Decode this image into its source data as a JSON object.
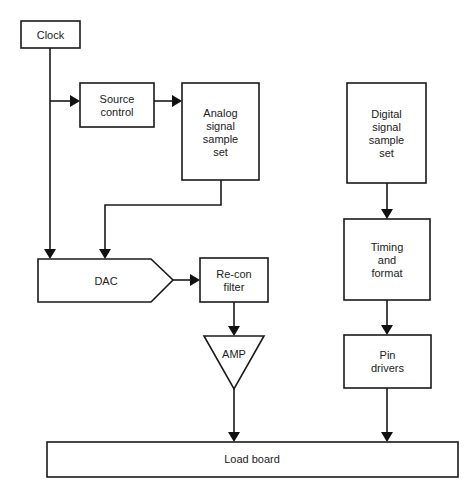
{
  "diagram": {
    "nodes": {
      "clock": {
        "label": [
          "Clock"
        ]
      },
      "source_control": {
        "label": [
          "Source",
          "control"
        ]
      },
      "analog_set": {
        "label": [
          "Analog",
          "signal",
          "sample",
          "set"
        ]
      },
      "digital_set": {
        "label": [
          "Digital",
          "signal",
          "sample",
          "set"
        ]
      },
      "dac": {
        "label": [
          "DAC"
        ]
      },
      "recon_filter": {
        "label": [
          "Re-con",
          "filter"
        ]
      },
      "amp": {
        "label": [
          "AMP"
        ]
      },
      "timing_format": {
        "label": [
          "Timing",
          "and",
          "format"
        ]
      },
      "pin_drivers": {
        "label": [
          "Pin",
          "drivers"
        ]
      },
      "load_board": {
        "label": [
          "Load board"
        ]
      }
    },
    "edges": [
      {
        "from": "Clock",
        "to": "Source control"
      },
      {
        "from": "Clock",
        "to": "DAC"
      },
      {
        "from": "Source control",
        "to": "Analog signal sample set"
      },
      {
        "from": "Analog signal sample set",
        "to": "DAC"
      },
      {
        "from": "DAC",
        "to": "Re-con filter"
      },
      {
        "from": "Re-con filter",
        "to": "AMP"
      },
      {
        "from": "AMP",
        "to": "Load board"
      },
      {
        "from": "Digital signal sample set",
        "to": "Timing and format"
      },
      {
        "from": "Timing and format",
        "to": "Pin drivers"
      },
      {
        "from": "Pin drivers",
        "to": "Load board"
      }
    ]
  }
}
